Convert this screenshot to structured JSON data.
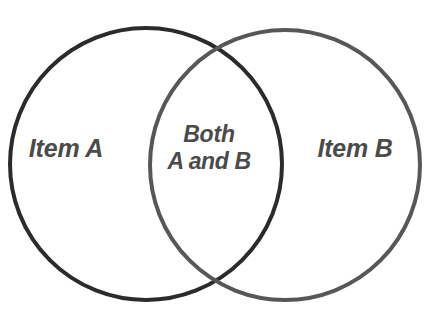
{
  "diagram": {
    "type": "venn",
    "background_color": "#ffffff",
    "text_color": "#4b4b4b",
    "sets": [
      {
        "id": "set-a",
        "label": "Item A",
        "stroke_color": "#2b2b2b",
        "stroke_width": 4,
        "cx": 146,
        "cy": 164,
        "r": 136,
        "label_x": 66,
        "label_y": 148
      },
      {
        "id": "set-b",
        "label": "Item B",
        "stroke_color": "#575757",
        "stroke_width": 4,
        "cx": 285,
        "cy": 165,
        "r": 135,
        "label_x": 355,
        "label_y": 148
      }
    ],
    "intersection": {
      "id": "set-ab",
      "label_line_1": "Both",
      "label_line_2": "A and B",
      "label_x": 209,
      "label_y": 148,
      "crossing_top": "218, 40",
      "crossing_bottom": "218, 295"
    }
  }
}
